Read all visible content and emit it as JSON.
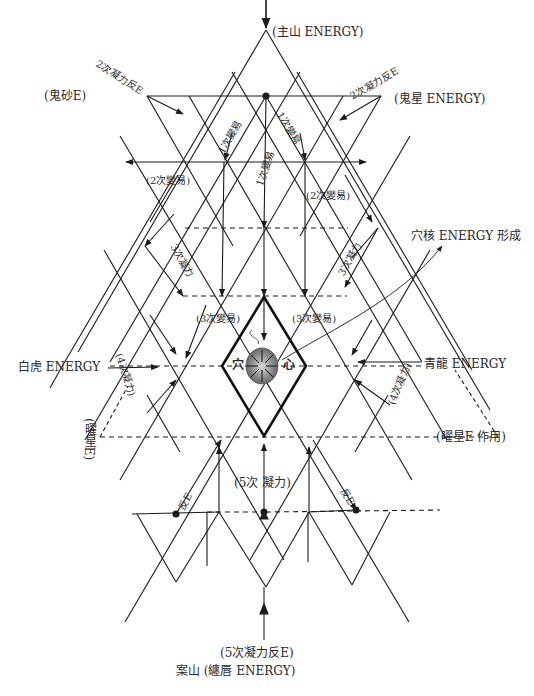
{
  "diagram": {
    "type": "feng-shui energy lattice",
    "labels": {
      "top": "(主山 ENERGY)",
      "top_left": "(鬼砂E)",
      "top_right": "(鬼星 ENERGY)",
      "secondary_reverse_left": "2次凝力反E",
      "secondary_reverse_right": "2次凝力反E",
      "primary_change_left": "1次變易",
      "primary_change_center": "1次變易",
      "primary_change_right": "1次變易",
      "secondary_change_left": "(2次變易)",
      "secondary_change_right": "(2次變易)",
      "tertiary_force_left": "3次凝力",
      "tertiary_force_right": "3次凝力",
      "tertiary_change_left": "(3次變易)",
      "tertiary_change_right": "(3次變易)",
      "core_annotation": "穴核 ENERGY 形成",
      "core_left": "穴",
      "core_right": "心",
      "west": "白虎 ENERGY",
      "east": "青龍 ENERGY",
      "quaternary_force_left": "(4次凝力)",
      "quaternary_force_right": "(4次凝力)",
      "yao_star_left": "(曜星E)",
      "yao_star_right": "(曜星E 作用)",
      "fifth_force": "(5次 凝力)",
      "reverse_left": "反E",
      "reverse_right": "反E",
      "fifth_reverse": "(5次凝力反E)",
      "bottom": "案山 (纏唇 ENERGY)"
    },
    "colors": {
      "line": "#1a1a1a",
      "core_fill": "#8a8a8a",
      "background": "#ffffff"
    }
  }
}
